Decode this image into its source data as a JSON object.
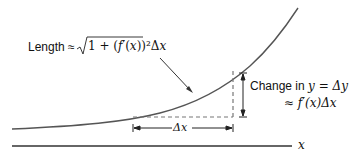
{
  "labels": {
    "length_prefix": "Length ≈ ",
    "length_formula": "√1 + (f′(x))²Δx",
    "change_line1_text": "Change in ",
    "change_line1_math": "y = Δy",
    "change_line2": "≈ f′(x)Δx",
    "delta_x": "Δx",
    "axis_x": "x"
  },
  "colors": {
    "curve": "#555555",
    "lines": "#222222",
    "dashed": "#777777"
  }
}
